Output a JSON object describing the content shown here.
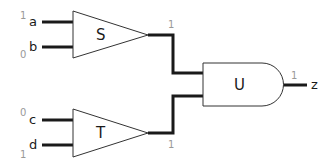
{
  "diagram": {
    "type": "logic-circuit",
    "inputs": [
      {
        "name": "a",
        "value": "1"
      },
      {
        "name": "b",
        "value": "0"
      },
      {
        "name": "c",
        "value": "0"
      },
      {
        "name": "d",
        "value": "1"
      }
    ],
    "gates": [
      {
        "id": "S",
        "label": "S",
        "shape": "triangle",
        "inputs": [
          "a",
          "b"
        ],
        "output_value": "1"
      },
      {
        "id": "T",
        "label": "T",
        "shape": "triangle",
        "inputs": [
          "c",
          "d"
        ],
        "output_value": "1"
      },
      {
        "id": "U",
        "label": "U",
        "shape": "and",
        "inputs": [
          "S",
          "T"
        ],
        "output_value": "1"
      }
    ],
    "output": {
      "name": "z",
      "value": "1"
    }
  }
}
